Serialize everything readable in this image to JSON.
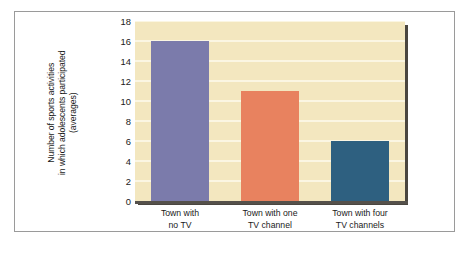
{
  "chart_data": {
    "type": "bar",
    "title": "",
    "subtitle": "",
    "xlabel": "",
    "ylabel": "Number of sports activities in which adolescents participated (averages)",
    "ylabel_lines": [
      "Number of sports activities",
      "in which adolescents participated",
      "(averages)"
    ],
    "categories": [
      "Town with no TV",
      "Town with one TV channel",
      "Town with four TV channels"
    ],
    "category_label_lines": [
      [
        "Town with",
        "no TV"
      ],
      [
        "Town with one",
        "TV channel"
      ],
      [
        "Town with four",
        "TV channels"
      ]
    ],
    "values": [
      16,
      11,
      6
    ],
    "ylim": [
      0,
      18
    ],
    "ytick_values": [
      0,
      2,
      4,
      6,
      8,
      10,
      12,
      14,
      16,
      18
    ],
    "ytick_labels": [
      "0",
      "2",
      "4",
      "6",
      "8",
      "10",
      "12",
      "14",
      "16",
      "18"
    ],
    "grid": true,
    "legend": "none",
    "bar_colors": [
      "#7b7bab",
      "#e8825f",
      "#2e6080"
    ],
    "plot_background": "#f3e7bf",
    "gridline_color": "#fbf6e2",
    "axis_color": "#55514b",
    "frame_color": "#9a9a9a",
    "page_background": "#ffffff"
  }
}
